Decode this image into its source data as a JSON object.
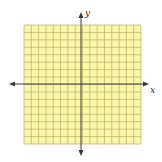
{
  "diagram": {
    "type": "coordinate-grid",
    "grid": {
      "columns": 16,
      "rows": 16,
      "fill_color": "#fbf7a8",
      "line_color": "#b7ae6a"
    },
    "axes": {
      "x_label": "x",
      "y_label": "y",
      "color": "#3a3a3a",
      "arrows": [
        "left",
        "right",
        "up",
        "down"
      ]
    }
  }
}
